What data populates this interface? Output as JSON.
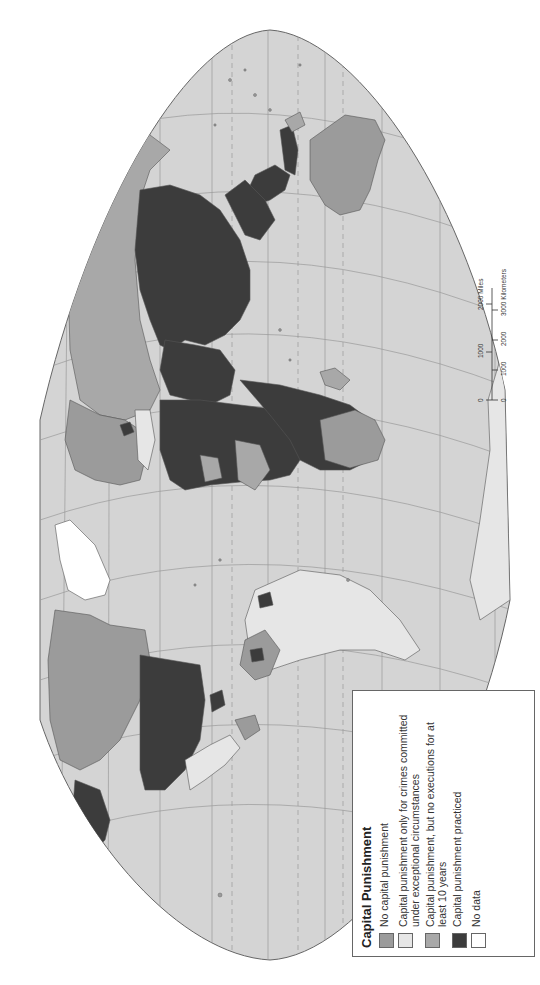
{
  "map": {
    "title": "Capital Punishment",
    "orientation": "rotated 90° counter-clockwise (north at left)",
    "colors": {
      "ocean": "#d4d4d4",
      "graticule": "#9a9a9a",
      "no_capital_punishment": "#9b9b9b",
      "exceptional_only": "#e6e6e6",
      "no_executions_10_years": "#a8a8a8",
      "practiced": "#3c3c3c",
      "no_data": "#ffffff",
      "outline": "#555555"
    }
  },
  "legend": {
    "title": "Capital Punishment",
    "items": [
      {
        "label": "No capital punishment",
        "color": "#9b9b9b"
      },
      {
        "label": "Capital punishment only for crimes committed under exceptional circumstances",
        "color": "#e6e6e6"
      },
      {
        "label": "Capital punishment, but no executions for at least 10 years",
        "color": "#a8a8a8"
      },
      {
        "label": "Capital punishment practiced",
        "color": "#3c3c3c"
      },
      {
        "label": "No data",
        "color": "#ffffff"
      }
    ]
  },
  "scale_bar": {
    "miles_ticks": [
      "0",
      "1000",
      "2000 Miles"
    ],
    "km_ticks": [
      "0",
      "1000",
      "2000",
      "3000 Kilometers"
    ]
  }
}
